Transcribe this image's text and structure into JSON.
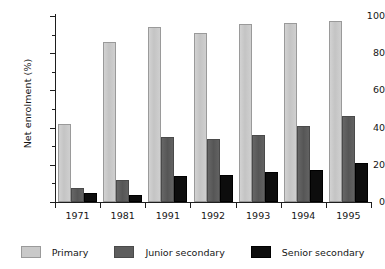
{
  "chart_data": {
    "type": "bar",
    "title": "",
    "xlabel": "",
    "ylabel": "Net enrolment (%)",
    "ylim": [
      0,
      100
    ],
    "yticks": [
      0,
      20,
      40,
      60,
      80,
      100
    ],
    "ytick_labels": [
      "0",
      "20",
      "40",
      "60",
      "80",
      "100"
    ],
    "grid": false,
    "legend_position": "bottom",
    "categories": [
      "1971",
      "1981",
      "1991",
      "1992",
      "1993",
      "1994",
      "1995"
    ],
    "series": [
      {
        "name": "Primary",
        "color": "#c9c9c9",
        "values": [
          42,
          86,
          94,
          91,
          95.5,
          96,
          97.5
        ]
      },
      {
        "name": "Junior secondary",
        "color": "#5d5d5d",
        "values": [
          7.5,
          12,
          35,
          34,
          36,
          41,
          46
        ]
      },
      {
        "name": "Senior secondary",
        "color": "#0d0d0d",
        "values": [
          5,
          4,
          14,
          14.5,
          16,
          17,
          21
        ]
      }
    ]
  },
  "axis": {
    "y_title": "Net enrolment (%)"
  },
  "legend": {
    "items": [
      {
        "label": "Primary",
        "swatch": "legend-swatch-primary"
      },
      {
        "label": "Junior secondary",
        "swatch": "legend-swatch-junior-secondary"
      },
      {
        "label": "Senior secondary",
        "swatch": "legend-swatch-senior-secondary"
      }
    ]
  }
}
